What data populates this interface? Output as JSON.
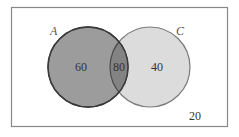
{
  "diagram": {
    "type": "venn",
    "universe": {
      "outside_value": "20"
    },
    "sets": [
      {
        "label": "A",
        "only_value": "60",
        "fill": "#9a9a9a",
        "stroke": "#3a3a3a"
      },
      {
        "label": "C",
        "only_value": "40",
        "fill": "#dcdcdc",
        "stroke": "#777777"
      }
    ],
    "intersection": {
      "value": "80",
      "fill": "#7f7f7f"
    },
    "colors": {
      "frame": "#777777",
      "background": "#ffffff",
      "text": "#333333"
    }
  }
}
